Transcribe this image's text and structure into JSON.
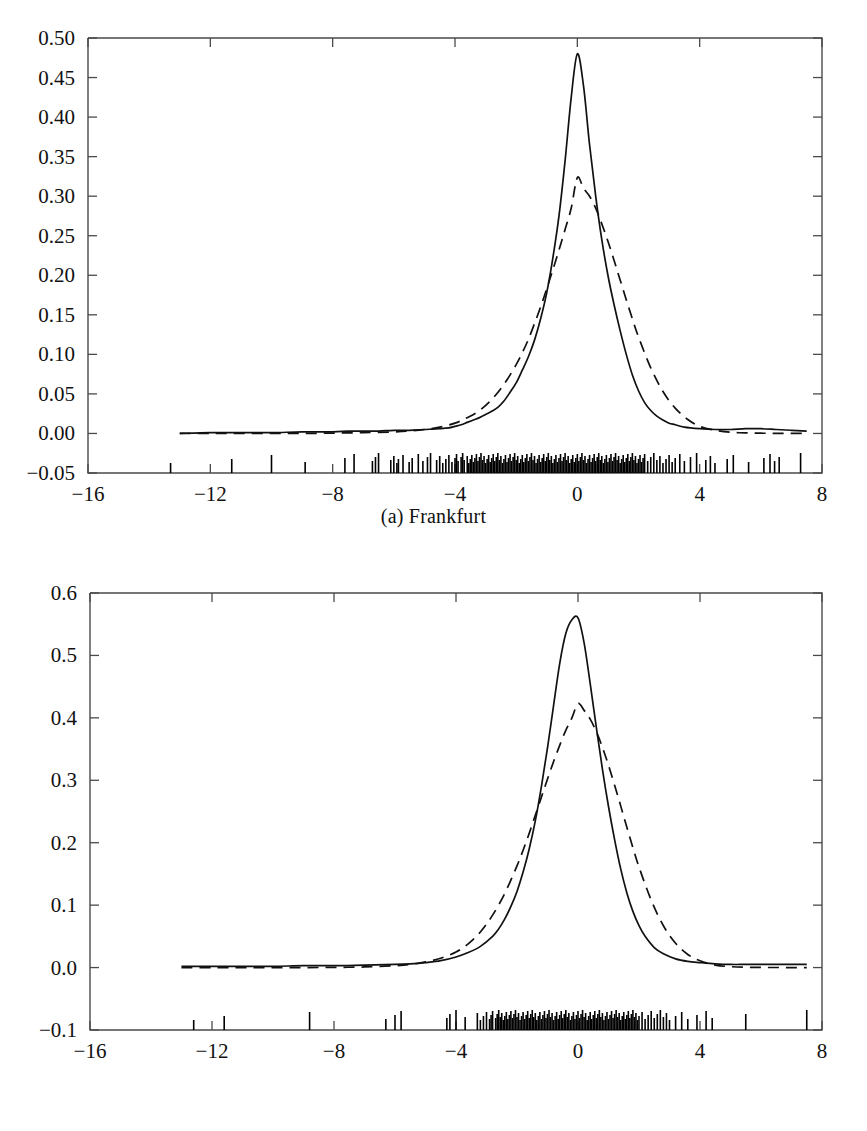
{
  "figure": {
    "panels": [
      {
        "id": "a",
        "caption": "(a) Frankfurt",
        "caption_prefix": "(a)",
        "caption_name": "Frankfurt"
      },
      {
        "id": "b",
        "caption": "(b) London",
        "caption_prefix": "(b)",
        "caption_name": "London"
      }
    ],
    "footer_partial_text": ""
  },
  "colors": {
    "axis": "#4a4a4a",
    "curve_solid": "#111111",
    "curve_dashed": "#111111",
    "rug": "#000000",
    "background": "#ffffff",
    "text": "#111111"
  },
  "chart_data": [
    {
      "type": "line",
      "title": "(a) Frankfurt",
      "subtitle": "",
      "xlabel": "",
      "ylabel": "",
      "xlim": [
        -16,
        8
      ],
      "ylim": [
        -0.05,
        0.5
      ],
      "xticks": [
        -16,
        -12,
        -8,
        -4,
        0,
        4,
        8
      ],
      "xticklabels": [
        "−16",
        "−12",
        "−8",
        "−4",
        "0",
        "4",
        "8"
      ],
      "yticks": [
        -0.05,
        0.0,
        0.05,
        0.1,
        0.15,
        0.2,
        0.25,
        0.3,
        0.35,
        0.4,
        0.45,
        0.5
      ],
      "yticklabels": [
        "−0.05",
        "0.00",
        "0.05",
        "0.10",
        "0.15",
        "0.20",
        "0.25",
        "0.30",
        "0.35",
        "0.40",
        "0.45",
        "0.50"
      ],
      "grid": false,
      "legend": "none",
      "series": [
        {
          "name": "kernel-density-estimate",
          "style": "solid",
          "x": [
            -13.0,
            -12.0,
            -11.0,
            -10.0,
            -9.0,
            -8.0,
            -7.5,
            -7.0,
            -6.5,
            -6.0,
            -5.5,
            -5.0,
            -4.5,
            -4.2,
            -4.0,
            -3.8,
            -3.6,
            -3.4,
            -3.2,
            -3.0,
            -2.8,
            -2.6,
            -2.4,
            -2.2,
            -2.0,
            -1.8,
            -1.6,
            -1.4,
            -1.2,
            -1.0,
            -0.8,
            -0.6,
            -0.4,
            -0.2,
            0.0,
            0.2,
            0.4,
            0.6,
            0.8,
            1.0,
            1.2,
            1.4,
            1.6,
            1.8,
            2.0,
            2.2,
            2.4,
            2.6,
            2.8,
            3.0,
            3.2,
            3.5,
            4.0,
            4.5,
            5.0,
            5.5,
            6.0,
            6.5,
            7.0,
            7.5
          ],
          "y": [
            0.0,
            0.001,
            0.001,
            0.001,
            0.002,
            0.002,
            0.003,
            0.003,
            0.003,
            0.004,
            0.004,
            0.005,
            0.006,
            0.007,
            0.009,
            0.011,
            0.014,
            0.017,
            0.02,
            0.024,
            0.028,
            0.033,
            0.041,
            0.052,
            0.064,
            0.08,
            0.097,
            0.118,
            0.145,
            0.178,
            0.222,
            0.275,
            0.345,
            0.425,
            0.48,
            0.44,
            0.365,
            0.3,
            0.245,
            0.2,
            0.163,
            0.13,
            0.1,
            0.074,
            0.054,
            0.039,
            0.029,
            0.022,
            0.017,
            0.013,
            0.011,
            0.008,
            0.006,
            0.005,
            0.005,
            0.006,
            0.006,
            0.005,
            0.004,
            0.003
          ]
        },
        {
          "name": "fitted-normal-density",
          "style": "dashed",
          "x": [
            -13.0,
            -12.0,
            -11.0,
            -10.0,
            -9.0,
            -8.0,
            -7.0,
            -6.0,
            -5.5,
            -5.0,
            -4.5,
            -4.0,
            -3.6,
            -3.2,
            -2.8,
            -2.4,
            -2.0,
            -1.8,
            -1.6,
            -1.4,
            -1.2,
            -1.0,
            -0.8,
            -0.6,
            -0.4,
            -0.2,
            0.0,
            0.2,
            0.4,
            0.6,
            0.8,
            1.0,
            1.2,
            1.4,
            1.6,
            1.8,
            2.0,
            2.4,
            2.8,
            3.2,
            3.6,
            4.0,
            4.5,
            5.0,
            5.5,
            6.0,
            6.5,
            7.0,
            7.5
          ],
          "y": [
            0.0,
            0.0,
            0.0,
            0.0,
            0.0,
            0.0005,
            0.001,
            0.002,
            0.003,
            0.005,
            0.008,
            0.013,
            0.02,
            0.029,
            0.043,
            0.062,
            0.087,
            0.102,
            0.119,
            0.139,
            0.16,
            0.183,
            0.207,
            0.232,
            0.258,
            0.285,
            0.3235,
            0.31,
            0.3,
            0.285,
            0.265,
            0.243,
            0.219,
            0.194,
            0.169,
            0.145,
            0.122,
            0.083,
            0.053,
            0.032,
            0.018,
            0.009,
            0.004,
            0.0015,
            0.0007,
            0.0003,
            0.0002,
            0.0001,
            0.0
          ]
        }
      ],
      "rug": {
        "name": "data-rug-marks",
        "baseline_y": -0.05,
        "description": "dense vertical tick marks for each observation along the bottom axis",
        "x": [
          -13.3,
          -11.3,
          -10.0,
          -8.9,
          -7.6,
          -7.3,
          -6.7,
          -6.6,
          -6.5,
          -6.1,
          -6.0,
          -5.9,
          -5.85,
          -5.7,
          -5.5,
          -5.4,
          -5.2,
          -5.05,
          -4.9,
          -4.8,
          -4.6,
          -4.5,
          -4.4,
          -4.3,
          -4.2,
          -4.1,
          -4.0,
          -3.95,
          -3.9,
          -3.8,
          -3.75,
          -3.7,
          -3.6,
          -3.55,
          -3.5,
          -3.45,
          -3.4,
          -3.35,
          -3.3,
          -3.25,
          -3.2,
          -3.15,
          -3.1,
          -3.05,
          -3.0,
          -2.95,
          -2.9,
          -2.85,
          -2.8,
          -2.75,
          -2.7,
          -2.65,
          -2.6,
          -2.55,
          -2.5,
          -2.45,
          -2.4,
          -2.35,
          -2.3,
          -2.25,
          -2.2,
          -2.15,
          -2.1,
          -2.05,
          -2.0,
          -1.95,
          -1.9,
          -1.85,
          -1.8,
          -1.75,
          -1.7,
          -1.65,
          -1.6,
          -1.55,
          -1.5,
          -1.45,
          -1.4,
          -1.35,
          -1.3,
          -1.25,
          -1.2,
          -1.15,
          -1.1,
          -1.05,
          -1.0,
          -0.95,
          -0.9,
          -0.85,
          -0.8,
          -0.75,
          -0.7,
          -0.65,
          -0.6,
          -0.55,
          -0.5,
          -0.45,
          -0.4,
          -0.35,
          -0.3,
          -0.25,
          -0.2,
          -0.15,
          -0.1,
          -0.05,
          0.0,
          0.05,
          0.1,
          0.15,
          0.2,
          0.25,
          0.3,
          0.35,
          0.4,
          0.45,
          0.5,
          0.55,
          0.6,
          0.65,
          0.7,
          0.75,
          0.8,
          0.85,
          0.9,
          0.95,
          1.0,
          1.05,
          1.1,
          1.15,
          1.2,
          1.25,
          1.3,
          1.35,
          1.4,
          1.45,
          1.5,
          1.55,
          1.6,
          1.65,
          1.7,
          1.75,
          1.8,
          1.85,
          1.9,
          1.95,
          2.0,
          2.05,
          2.1,
          2.15,
          2.2,
          2.3,
          2.4,
          2.5,
          2.6,
          2.7,
          2.8,
          2.9,
          3.0,
          3.1,
          3.2,
          3.35,
          3.5,
          3.7,
          3.9,
          4.2,
          4.35,
          4.5,
          4.9,
          5.1,
          5.6,
          6.1,
          6.3,
          6.45,
          6.6,
          7.3
        ]
      }
    },
    {
      "type": "line",
      "title": "(b) London",
      "subtitle": "",
      "xlabel": "",
      "ylabel": "",
      "xlim": [
        -16,
        8
      ],
      "ylim": [
        -0.1,
        0.6
      ],
      "xticks": [
        -16,
        -12,
        -8,
        -4,
        0,
        4,
        8
      ],
      "xticklabels": [
        "−16",
        "−12",
        "−8",
        "−4",
        "0",
        "4",
        "8"
      ],
      "yticks": [
        -0.1,
        0.0,
        0.1,
        0.2,
        0.3,
        0.4,
        0.5,
        0.6
      ],
      "yticklabels": [
        "−0.1",
        "0.0",
        "0.1",
        "0.2",
        "0.3",
        "0.4",
        "0.5",
        "0.6"
      ],
      "grid": false,
      "legend": "none",
      "series": [
        {
          "name": "kernel-density-estimate",
          "style": "solid",
          "x": [
            -13.0,
            -12.0,
            -11.0,
            -10.0,
            -9.0,
            -8.0,
            -7.0,
            -6.0,
            -5.5,
            -5.0,
            -4.5,
            -4.0,
            -3.6,
            -3.2,
            -2.8,
            -2.6,
            -2.4,
            -2.2,
            -2.0,
            -1.8,
            -1.6,
            -1.4,
            -1.2,
            -1.0,
            -0.8,
            -0.6,
            -0.4,
            -0.2,
            0.0,
            0.2,
            0.4,
            0.6,
            0.8,
            1.0,
            1.2,
            1.4,
            1.6,
            1.8,
            2.0,
            2.2,
            2.5,
            2.8,
            3.2,
            3.6,
            4.0,
            4.5,
            5.0,
            5.5,
            6.0,
            6.5,
            7.0,
            7.5
          ],
          "y": [
            0.002,
            0.002,
            0.002,
            0.002,
            0.003,
            0.003,
            0.004,
            0.005,
            0.006,
            0.008,
            0.011,
            0.017,
            0.024,
            0.034,
            0.05,
            0.062,
            0.078,
            0.098,
            0.122,
            0.153,
            0.19,
            0.235,
            0.29,
            0.352,
            0.42,
            0.487,
            0.535,
            0.557,
            0.56,
            0.52,
            0.455,
            0.385,
            0.318,
            0.258,
            0.205,
            0.158,
            0.12,
            0.09,
            0.067,
            0.05,
            0.032,
            0.022,
            0.014,
            0.01,
            0.008,
            0.006,
            0.005,
            0.005,
            0.005,
            0.005,
            0.005,
            0.005
          ]
        },
        {
          "name": "fitted-normal-density",
          "style": "dashed",
          "x": [
            -13.0,
            -12.0,
            -11.0,
            -10.0,
            -9.0,
            -8.0,
            -7.0,
            -6.0,
            -5.5,
            -5.0,
            -4.5,
            -4.0,
            -3.6,
            -3.2,
            -2.8,
            -2.4,
            -2.0,
            -1.8,
            -1.6,
            -1.4,
            -1.2,
            -1.0,
            -0.8,
            -0.6,
            -0.4,
            -0.2,
            0.0,
            0.2,
            0.4,
            0.6,
            0.8,
            1.0,
            1.2,
            1.4,
            1.6,
            1.8,
            2.0,
            2.4,
            2.8,
            3.2,
            3.6,
            4.0,
            4.5,
            5.0,
            5.5,
            6.0,
            6.5,
            7.0,
            7.5
          ],
          "y": [
            0.0,
            0.0,
            0.0,
            0.0,
            0.0,
            0.0003,
            0.001,
            0.003,
            0.005,
            0.009,
            0.015,
            0.025,
            0.038,
            0.057,
            0.084,
            0.119,
            0.163,
            0.188,
            0.215,
            0.244,
            0.273,
            0.302,
            0.33,
            0.356,
            0.38,
            0.4,
            0.423,
            0.412,
            0.398,
            0.378,
            0.353,
            0.324,
            0.292,
            0.259,
            0.225,
            0.192,
            0.161,
            0.108,
            0.067,
            0.039,
            0.021,
            0.011,
            0.004,
            0.0015,
            0.0005,
            0.0002,
            0.0001,
            0.0,
            0.0
          ]
        }
      ],
      "rug": {
        "name": "data-rug-marks",
        "baseline_y": -0.1,
        "description": "dense vertical tick marks for each observation along the bottom axis",
        "x": [
          -12.6,
          -11.6,
          -8.8,
          -6.3,
          -6.0,
          -5.8,
          -4.3,
          -4.2,
          -4.0,
          -3.7,
          -3.3,
          -3.2,
          -3.1,
          -3.0,
          -2.9,
          -2.85,
          -2.8,
          -2.7,
          -2.65,
          -2.6,
          -2.55,
          -2.5,
          -2.45,
          -2.4,
          -2.35,
          -2.3,
          -2.25,
          -2.2,
          -2.15,
          -2.1,
          -2.05,
          -2.0,
          -1.95,
          -1.9,
          -1.85,
          -1.8,
          -1.75,
          -1.7,
          -1.65,
          -1.6,
          -1.55,
          -1.5,
          -1.45,
          -1.4,
          -1.35,
          -1.3,
          -1.25,
          -1.2,
          -1.15,
          -1.1,
          -1.05,
          -1.0,
          -0.95,
          -0.9,
          -0.85,
          -0.8,
          -0.75,
          -0.7,
          -0.65,
          -0.6,
          -0.55,
          -0.5,
          -0.45,
          -0.4,
          -0.35,
          -0.3,
          -0.25,
          -0.2,
          -0.15,
          -0.1,
          -0.05,
          0.0,
          0.05,
          0.1,
          0.15,
          0.2,
          0.25,
          0.3,
          0.35,
          0.4,
          0.45,
          0.5,
          0.55,
          0.6,
          0.65,
          0.7,
          0.75,
          0.8,
          0.85,
          0.9,
          0.95,
          1.0,
          1.05,
          1.1,
          1.15,
          1.2,
          1.25,
          1.3,
          1.35,
          1.4,
          1.45,
          1.5,
          1.55,
          1.6,
          1.65,
          1.7,
          1.75,
          1.8,
          1.85,
          1.9,
          1.95,
          2.0,
          2.1,
          2.2,
          2.3,
          2.4,
          2.5,
          2.6,
          2.7,
          2.8,
          2.9,
          3.0,
          3.2,
          3.4,
          3.6,
          3.9,
          4.2,
          4.4,
          5.5,
          7.5
        ]
      }
    }
  ]
}
